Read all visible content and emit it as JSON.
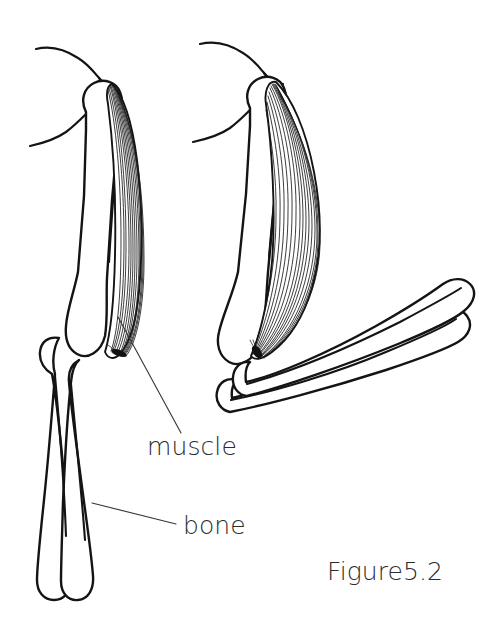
{
  "figure": {
    "caption": "Figure5.2",
    "background_color": "#ffffff",
    "ink_color": "#141414",
    "label_color": "#2b2b2b"
  },
  "labels": {
    "muscle": "muscle",
    "bone": "bone"
  },
  "callouts": [
    {
      "id": "muscle",
      "text": "muscle",
      "text_x": 147,
      "text_y": 455,
      "leader_from_x": 118,
      "leader_from_y": 317,
      "leader_to_x": 181,
      "leader_to_y": 433
    },
    {
      "id": "bone",
      "text": "bone",
      "text_x": 183,
      "text_y": 534,
      "leader_from_x": 92,
      "leader_from_y": 503,
      "leader_to_x": 176,
      "leader_to_y": 524
    }
  ],
  "diagram": {
    "title_not_shown": "",
    "arm_relaxed": {
      "state_label": "relaxed",
      "position": "left",
      "parts": [
        "shoulder-contour",
        "humerus",
        "muscle-relaxed",
        "radius",
        "ulna"
      ]
    },
    "arm_contracted": {
      "state_label": "contracted",
      "position": "right",
      "parts": [
        "shoulder-contour",
        "humerus",
        "muscle-contracted",
        "radius",
        "ulna"
      ]
    }
  }
}
